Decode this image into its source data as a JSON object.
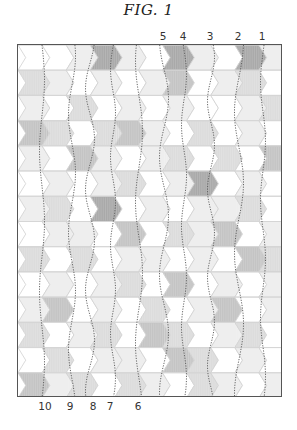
{
  "figure": {
    "title": "FIG. 1",
    "top_labels": [
      {
        "text": "5",
        "x": 163
      },
      {
        "text": "4",
        "x": 183
      },
      {
        "text": "3",
        "x": 210
      },
      {
        "text": "2",
        "x": 238
      },
      {
        "text": "1",
        "x": 262
      }
    ],
    "bottom_labels": [
      {
        "text": "10",
        "x": 45
      },
      {
        "text": "9",
        "x": 70
      },
      {
        "text": "8",
        "x": 93
      },
      {
        "text": "7",
        "x": 110
      },
      {
        "text": "6",
        "x": 138
      }
    ],
    "grid": {
      "columns": 11,
      "rows": 14,
      "shades": [
        "#ffffff",
        "#eeeeee",
        "#dcdcdc",
        "#c4c4c4",
        "#a9a9a9"
      ],
      "tile_shape": "chevron-right",
      "map": [
        [
          0,
          0,
          1,
          4,
          1,
          0,
          4,
          1,
          0,
          4,
          1
        ],
        [
          2,
          1,
          0,
          1,
          0,
          1,
          3,
          0,
          1,
          2,
          0
        ],
        [
          1,
          0,
          2,
          0,
          1,
          0,
          1,
          0,
          0,
          1,
          2
        ],
        [
          3,
          2,
          0,
          2,
          3,
          1,
          0,
          2,
          0,
          1,
          0
        ],
        [
          1,
          0,
          3,
          1,
          0,
          1,
          2,
          0,
          2,
          0,
          3
        ],
        [
          0,
          1,
          0,
          1,
          2,
          0,
          1,
          4,
          0,
          1,
          0
        ],
        [
          1,
          2,
          0,
          4,
          0,
          1,
          0,
          1,
          1,
          2,
          0
        ],
        [
          0,
          1,
          1,
          0,
          3,
          0,
          2,
          1,
          3,
          0,
          1
        ],
        [
          2,
          0,
          2,
          0,
          1,
          1,
          0,
          1,
          0,
          3,
          2
        ],
        [
          0,
          1,
          0,
          1,
          2,
          0,
          3,
          0,
          1,
          0,
          1
        ],
        [
          1,
          3,
          0,
          1,
          0,
          2,
          0,
          1,
          3,
          0,
          1
        ],
        [
          2,
          0,
          1,
          2,
          0,
          3,
          2,
          0,
          1,
          2,
          0
        ],
        [
          0,
          2,
          0,
          1,
          1,
          0,
          3,
          2,
          0,
          1,
          0
        ],
        [
          3,
          1,
          2,
          0,
          2,
          1,
          0,
          2,
          1,
          0,
          1
        ]
      ]
    },
    "dotted_lines": [
      {
        "label": "10",
        "x": 24
      },
      {
        "label": "9",
        "x": 54
      },
      {
        "label": "8",
        "x": 72
      },
      {
        "label": "7",
        "x": 95
      },
      {
        "label": "6",
        "x": 121
      },
      {
        "label": "5",
        "x": 146
      },
      {
        "label": "4",
        "x": 166
      },
      {
        "label": "3",
        "x": 193
      },
      {
        "label": "2",
        "x": 221
      },
      {
        "label": "1",
        "x": 245
      }
    ]
  }
}
